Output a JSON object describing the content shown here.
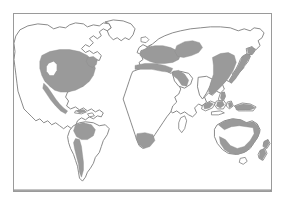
{
  "figure": {
    "kind": "world-distribution-map",
    "title": "",
    "caption": "",
    "projection": "equirectangular",
    "has_labels": false,
    "has_legend": false,
    "has_graticule": false
  },
  "frame": {
    "border_color": "#9a9a9a",
    "background_color": "#ffffff",
    "x": 13,
    "y": 13,
    "width": 259,
    "height": 179
  },
  "style": {
    "land_fill": "#ffffff",
    "coastline_color": "#7d7d7d",
    "range_fill": "#9a9a9a",
    "range_outline": "#8a8a8a",
    "ocean_fill": "#ffffff",
    "page_background": "#ffffff"
  },
  "map": {
    "continents": [
      {
        "name": "north-america",
        "shaded": true
      },
      {
        "name": "south-america",
        "shaded": true
      },
      {
        "name": "europe",
        "shaded": true
      },
      {
        "name": "africa",
        "shaded": true
      },
      {
        "name": "asia",
        "shaded": true
      },
      {
        "name": "australia",
        "shaded": true
      },
      {
        "name": "greenland",
        "shaded": false
      },
      {
        "name": "antarctica",
        "shaded": false
      }
    ],
    "shaded_regions": [
      {
        "id": "region-north-america",
        "label": "North America",
        "note": "United States and southern Canada, with unshaded interior pocket in the Great Basin / Rocky Mountains"
      },
      {
        "id": "region-mexico",
        "label": "Mexico and Central America",
        "note": "narrow coastal strip"
      },
      {
        "id": "region-caribbean",
        "label": "Caribbean islands",
        "note": "small shaded islands"
      },
      {
        "id": "region-south-america-north",
        "label": "Northern South America",
        "note": "Andean and northern belt"
      },
      {
        "id": "region-south-america-west",
        "label": "Western South America",
        "note": "narrow Andean strip down to southern Chile"
      },
      {
        "id": "region-europe",
        "label": "Europe",
        "note": "western and central Europe"
      },
      {
        "id": "region-mediterranean",
        "label": "Mediterranean coast",
        "note": "North African and Levantine coastal strip"
      },
      {
        "id": "region-west-asia",
        "label": "Western and Central Asia",
        "note": "band east of the Caspian Sea"
      },
      {
        "id": "region-arabia",
        "label": "Arabian peninsula and Red Sea coast",
        "note": "narrow strip"
      },
      {
        "id": "region-south-africa",
        "label": "Southern Africa",
        "note": "South African cape region"
      },
      {
        "id": "region-east-asia",
        "label": "Eastern Asia",
        "note": "eastern China and Korean peninsula"
      },
      {
        "id": "region-japan",
        "label": "Japan",
        "note": "full archipelago arc"
      },
      {
        "id": "region-island-southeast-asia",
        "label": "Island Southeast Asia",
        "note": "Philippines, Indonesia and New Guinea islands"
      },
      {
        "id": "region-australia",
        "label": "Australia",
        "note": "northern, eastern and southern coastal belt"
      },
      {
        "id": "region-new-zealand",
        "label": "New Zealand",
        "note": "both main islands"
      }
    ]
  }
}
